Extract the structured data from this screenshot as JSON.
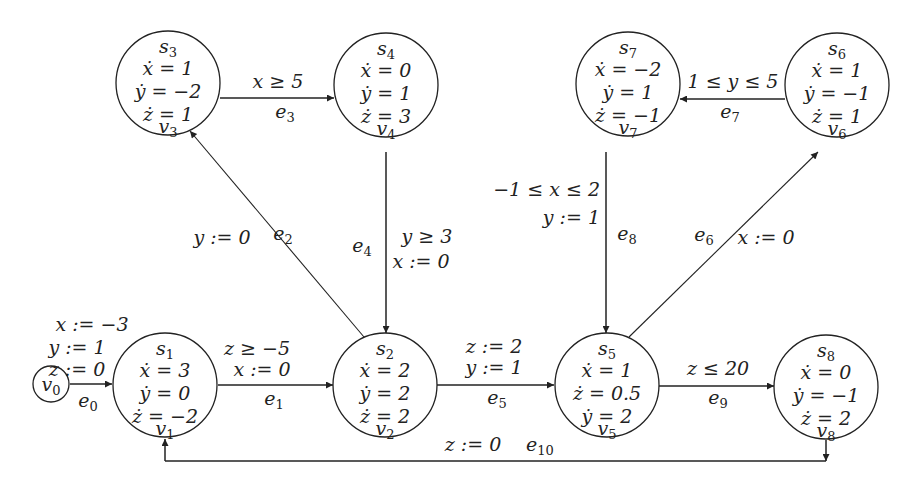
{
  "diagram": {
    "type": "hybrid-automaton",
    "initial": {
      "id": "v0",
      "label": "v0",
      "assignments": [
        "x := −3",
        "y := 1",
        "z := 0"
      ]
    },
    "nodes": [
      {
        "id": "v1",
        "state": "s1",
        "vertex": "v1",
        "flows": [
          "ẋ = 3",
          "ẏ = 0",
          "ż = −2"
        ],
        "cx": 165,
        "cy": 385
      },
      {
        "id": "v2",
        "state": "s2",
        "vertex": "v2",
        "flows": [
          "ẋ = 2",
          "ẏ = 2",
          "ż = 2"
        ],
        "cx": 385,
        "cy": 385
      },
      {
        "id": "v3",
        "state": "s3",
        "vertex": "v3",
        "flows": [
          "ẋ = 1",
          "ẏ = −2",
          "ż = 1"
        ],
        "cx": 168,
        "cy": 83
      },
      {
        "id": "v4",
        "state": "s4",
        "vertex": "v4",
        "flows": [
          "ẋ = 0",
          "ẏ = 1",
          "ż = 3"
        ],
        "cx": 386,
        "cy": 85
      },
      {
        "id": "v5",
        "state": "s5",
        "vertex": "v5",
        "flows": [
          "ẋ = 1",
          "ż = 0.5",
          "ẏ = 2"
        ],
        "cx": 607,
        "cy": 385
      },
      {
        "id": "v6",
        "state": "s6",
        "vertex": "v6",
        "flows": [
          "ẋ = 1",
          "ẏ = −1",
          "ż = 1"
        ],
        "cx": 837,
        "cy": 85
      },
      {
        "id": "v7",
        "state": "s7",
        "vertex": "v7",
        "flows": [
          "ẋ = −2",
          "ẏ = 1",
          "ż = −1"
        ],
        "cx": 628,
        "cy": 84
      },
      {
        "id": "v8",
        "state": "s8",
        "vertex": "v8",
        "flows": [
          "ẋ = 0",
          "ẏ = −1",
          "ż = 2"
        ],
        "cx": 826,
        "cy": 387
      }
    ],
    "edges": [
      {
        "id": "e0",
        "label": "e0",
        "from": "v0",
        "to": "v1",
        "guard": "",
        "reset": ""
      },
      {
        "id": "e1",
        "label": "e1",
        "from": "v1",
        "to": "v2",
        "guard": "z ≥ −5",
        "reset": "x := 0"
      },
      {
        "id": "e2",
        "label": "e2",
        "from": "v2",
        "to": "v3",
        "guard": "",
        "reset": "y := 0"
      },
      {
        "id": "e3",
        "label": "e3",
        "from": "v3",
        "to": "v4",
        "guard": "x ≥ 5",
        "reset": ""
      },
      {
        "id": "e4",
        "label": "e4",
        "from": "v4",
        "to": "v2",
        "guard": "y ≥ 3",
        "reset": "x := 0"
      },
      {
        "id": "e5",
        "label": "e5",
        "from": "v2",
        "to": "v5",
        "guard": "z := 2",
        "reset": "y := 1"
      },
      {
        "id": "e6",
        "label": "e6",
        "from": "v5",
        "to": "v6",
        "guard": "",
        "reset": "x := 0"
      },
      {
        "id": "e7",
        "label": "e7",
        "from": "v6",
        "to": "v7",
        "guard": "1 ≤ y ≤ 5",
        "reset": ""
      },
      {
        "id": "e8",
        "label": "e8",
        "from": "v7",
        "to": "v5",
        "guard": "−1 ≤ x ≤ 2",
        "reset": "y := 1"
      },
      {
        "id": "e9",
        "label": "e9",
        "from": "v5",
        "to": "v8",
        "guard": "z ≤ 20",
        "reset": ""
      },
      {
        "id": "e10",
        "label": "e10",
        "from": "v8",
        "to": "v1",
        "guard": "",
        "reset": "z := 0"
      }
    ]
  }
}
